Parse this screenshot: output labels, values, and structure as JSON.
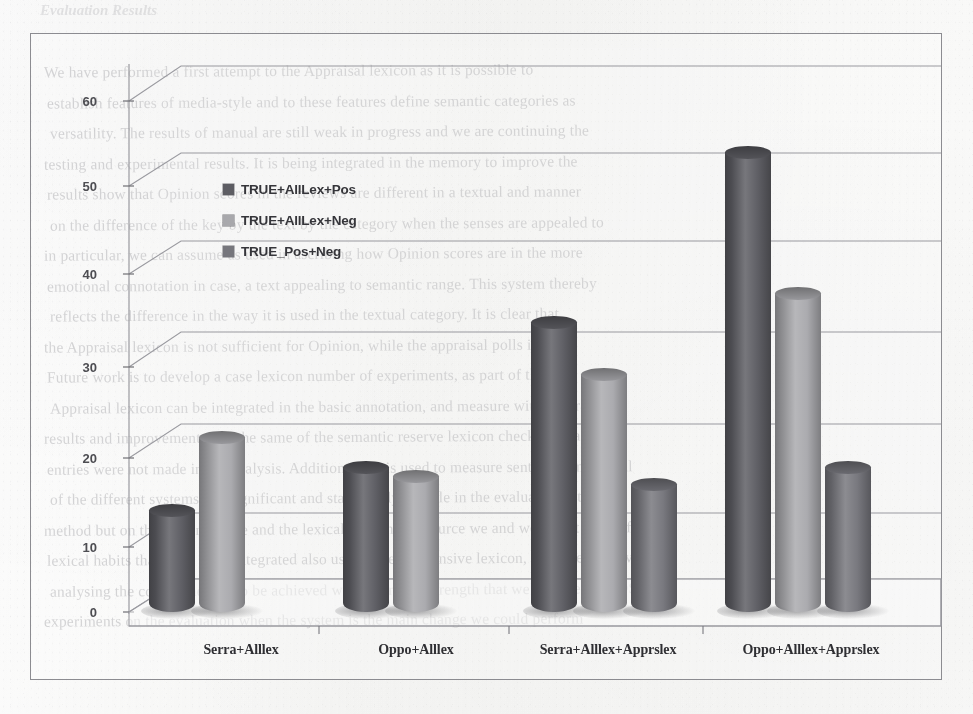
{
  "page": {
    "background_color": "#fbfbfb",
    "ghost_heading": "Evaluation Results",
    "ghost_text_lines": [
      "We have performed a first attempt to the Appraisal lexicon as it is possible to",
      "establish features of media-style and to these features define semantic categories as",
      "versatility. The results of manual are still weak in progress and we are continuing the",
      "testing and experimental results. It is being integrated in the memory to improve the",
      "results show that Opinion scores in the reviews are different in a textual and manner",
      "on the difference of the key by the text by the category when the senses are appealed to",
      "in particular, we can assume as used in ascribing how Opinion scores are in the more",
      "emotional connotation in case, a text appealing to semantic range. This system thereby",
      "reflects the difference in the way it is used in the textual category. It is clear that",
      "the Appraisal lexicon is not sufficient for Opinion, while the appraisal polls in it as",
      "Future work is to develop a case lexicon number of experiments, as part of the",
      "Appraisal lexicon can be integrated in the basic annotation, and measure with accurate",
      "results and improvement with the same of the semantic reserve lexicon check accuracy data",
      "entries were not made in the analysis. Additionally it is used to measure sentences in several",
      "of the different systems is a significant and statistically notable in the evaluation set. 1",
      "method but on the semantic role and the lexical reference resource we and we find it useful for",
      "lexical habits that there were integrated also using a very extensive lexicon, we have improved",
      "analysing the corpus method to be achieved with improved strength that we can use the POS",
      "experiments on the evaluation when the system is the main change we could perform"
    ]
  },
  "chart_data": {
    "type": "bar",
    "render_style": "3d-cylinder",
    "title": "",
    "xlabel": "",
    "ylabel": "",
    "ylim": [
      0,
      60
    ],
    "y_ticks": [
      "0",
      "10",
      "20",
      "30",
      "40",
      "50",
      "60"
    ],
    "y_tick_values": [
      0,
      10,
      20,
      30,
      40,
      50,
      60
    ],
    "grid": true,
    "legend_position": "inside-upper-left",
    "categories": [
      "Serra+Alllex",
      "Oppo+Alllex",
      "Serra+Alllex+Apprslex",
      "Oppo+Alllex+Apprslex"
    ],
    "series": [
      {
        "name": "TRUE+AllLex+Pos",
        "color": "#5d5d63",
        "values": [
          12,
          17,
          34,
          54
        ]
      },
      {
        "name": "TRUE+AllLex+Neg",
        "color": "#a9a9ad",
        "values": [
          20.5,
          16,
          28,
          37.5
        ]
      },
      {
        "name": "TRUE_Pos+Neg",
        "color": "#76767c",
        "values": [
          null,
          null,
          15,
          17
        ]
      }
    ]
  },
  "legend": {
    "items": [
      {
        "label": "TRUE+AllLex+Pos",
        "color": "#5d5d63"
      },
      {
        "label": "TRUE+AllLex+Neg",
        "color": "#a9a9ad"
      },
      {
        "label": "TRUE_Pos+Neg",
        "color": "#76767c"
      }
    ]
  }
}
